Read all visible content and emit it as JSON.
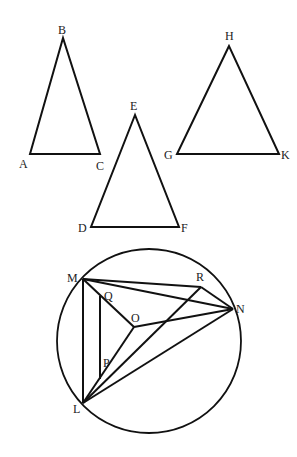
{
  "figures": {
    "triangle_abc": {
      "labels": {
        "A": "A",
        "B": "B",
        "C": "C"
      }
    },
    "triangle_def": {
      "labels": {
        "D": "D",
        "E": "E",
        "F": "F"
      }
    },
    "triangle_ghk": {
      "labels": {
        "G": "G",
        "H": "H",
        "K": "K"
      }
    },
    "circle_figure": {
      "labels": {
        "M": "M",
        "N": "N",
        "L": "L",
        "R": "R",
        "O": "O",
        "Q": "Q",
        "P": "P"
      }
    }
  },
  "colors": {
    "stroke": "#111111",
    "label": "#222222",
    "background": "#ffffff"
  }
}
